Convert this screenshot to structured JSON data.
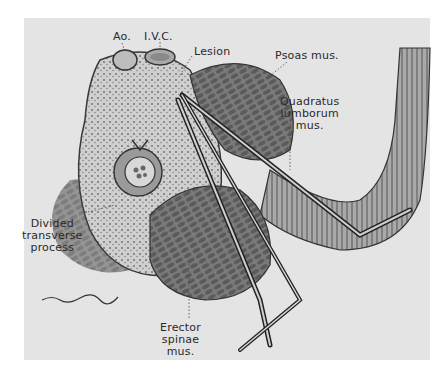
{
  "figure": {
    "type": "anatomical cross-section illustration",
    "background_color": "#e4e4e4",
    "ink_color": "#2a2a2a"
  },
  "labels": {
    "aorta": "Ao.",
    "ivc": "I.V.C.",
    "lesion": "Lesion",
    "psoas": "Psoas mus.",
    "quadratus": [
      "Quadratus",
      "lumborum",
      "mus."
    ],
    "transverse": [
      "Divided",
      "transverse",
      "process"
    ],
    "erector": [
      "Erector",
      "spinae",
      "mus."
    ]
  },
  "signature": "illustrator signature (illegible)"
}
